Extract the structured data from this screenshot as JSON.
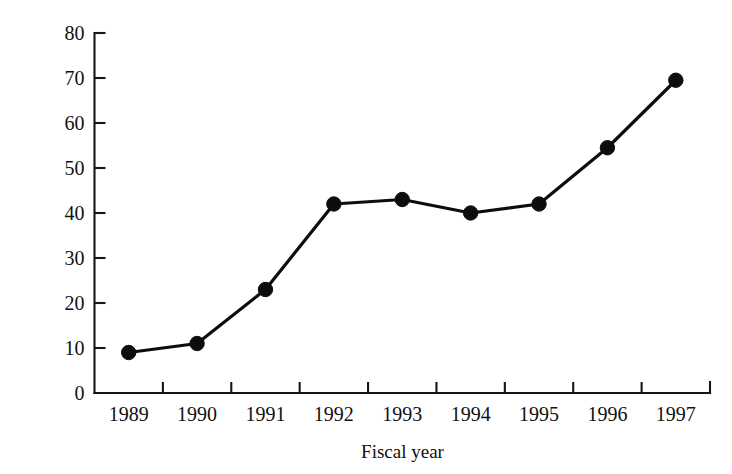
{
  "chart_data": {
    "type": "line",
    "title": "",
    "xlabel": "Fiscal year",
    "ylabel": "Thousands",
    "categories": [
      "1989",
      "1990",
      "1991",
      "1992",
      "1993",
      "1994",
      "1995",
      "1996",
      "1997"
    ],
    "values": [
      9,
      11,
      23,
      42,
      43,
      40,
      42,
      54.5,
      69.5
    ],
    "series": [
      {
        "name": "Fiscal year series",
        "values": [
          9,
          11,
          23,
          42,
          43,
          40,
          42,
          54.5,
          69.5
        ]
      }
    ],
    "ylim": [
      0,
      80
    ],
    "ytick_labels": [
      "0",
      "10",
      "20",
      "30",
      "40",
      "50",
      "60",
      "70",
      "80"
    ],
    "ytick_values": [
      0,
      10,
      20,
      30,
      40,
      50,
      60,
      70,
      80
    ],
    "xtick_labels": [
      "1989",
      "1990",
      "1991",
      "1992",
      "1993",
      "1994",
      "1995",
      "1996",
      "1997"
    ],
    "grid": false,
    "legend": false,
    "legend_position": "none",
    "marker": "filled-circle",
    "line_color": "#0d0d0d",
    "marker_color": "#0d0d0d",
    "axis_color": "#161616",
    "background_color": "#ffffff"
  }
}
